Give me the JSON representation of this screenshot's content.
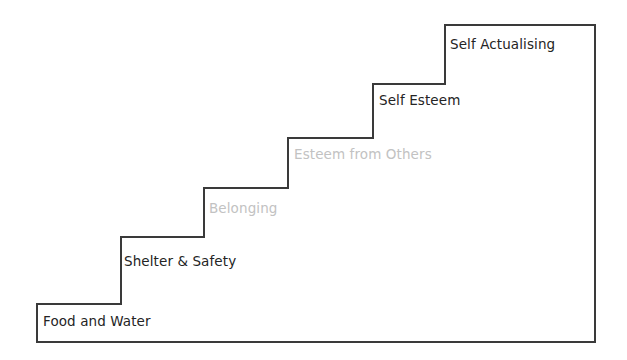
{
  "diagram": {
    "type": "staircase",
    "background_color": "#ffffff",
    "outline_color": "#3a3a3a",
    "outline_width_px": 2,
    "label_color_dark": "#242424",
    "label_color_muted": "#c2c2c2",
    "canvas": {
      "width": 627,
      "height": 360
    },
    "geometry": {
      "left_x": 37,
      "right_x": 595,
      "bottom_y": 342,
      "top_y": 25,
      "riser_x": [
        121,
        204,
        288,
        373,
        445
      ],
      "tread_y": [
        304,
        237,
        188,
        138,
        84,
        25
      ]
    },
    "steps": [
      {
        "index": 1,
        "label": "Food and Water",
        "emphasis": "dark",
        "label_x": 43,
        "label_y": 315,
        "tread_y": 304,
        "from_x": 37,
        "to_x": 121
      },
      {
        "index": 2,
        "label": "Shelter & Safety",
        "emphasis": "dark",
        "label_x": 124,
        "label_y": 255,
        "tread_y": 237,
        "from_x": 121,
        "to_x": 204
      },
      {
        "index": 3,
        "label": "Belonging",
        "emphasis": "muted",
        "label_x": 209,
        "label_y": 202,
        "tread_y": 188,
        "from_x": 204,
        "to_x": 288
      },
      {
        "index": 4,
        "label": "Esteem from Others",
        "emphasis": "muted",
        "label_x": 294,
        "label_y": 148,
        "tread_y": 138,
        "from_x": 288,
        "to_x": 373
      },
      {
        "index": 5,
        "label": "Self Esteem",
        "emphasis": "dark",
        "label_x": 379,
        "label_y": 94,
        "tread_y": 84,
        "from_x": 373,
        "to_x": 445
      },
      {
        "index": 6,
        "label": "Self Actualising",
        "emphasis": "dark",
        "label_x": 450,
        "label_y": 38,
        "tread_y": 25,
        "from_x": 445,
        "to_x": 595
      }
    ],
    "outline_path": "M 37 342 L 37 304 L 121 304 L 121 237 L 204 237 L 204 188 L 288 188 L 288 138 L 373 138 L 373 84 L 445 84 L 445 25 L 595 25 L 595 342 Z"
  }
}
